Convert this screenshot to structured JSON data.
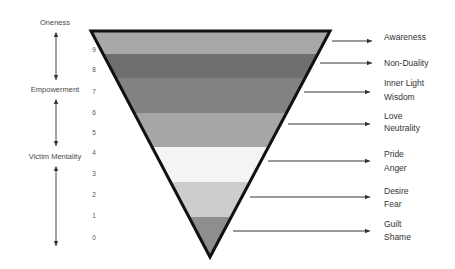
{
  "left_axis": {
    "labels": [
      {
        "text": "Oneness",
        "x": 55,
        "y": 25
      },
      {
        "text": "Empowerment",
        "x": 55,
        "y": 92
      },
      {
        "text": "Victim Mentality",
        "x": 55,
        "y": 159
      }
    ]
  },
  "levels": [
    "9",
    "8",
    "7",
    "6",
    "5",
    "4",
    "3",
    "2",
    "1",
    "0"
  ],
  "bands": [
    {
      "color": "#a8a8a8"
    },
    {
      "color": "#6f6f6f"
    },
    {
      "color": "#838383"
    },
    {
      "color": "#a6a6a6"
    },
    {
      "color": "#f4f4f4"
    },
    {
      "color": "#cdcdcd"
    },
    {
      "color": "#8e8e8e"
    }
  ],
  "right_labels": [
    {
      "line1": "Awareness",
      "line2": ""
    },
    {
      "line1": "Non-Duality",
      "line2": ""
    },
    {
      "line1": "Inner Light",
      "line2": "Wisdom"
    },
    {
      "line1": "Love",
      "line2": "Neutrality"
    },
    {
      "line1": "Pride",
      "line2": "Anger"
    },
    {
      "line1": "Desire",
      "line2": "Fear"
    },
    {
      "line1": "Guilt",
      "line2": "Shame"
    }
  ],
  "colors": {
    "outline": "#111111",
    "arrow": "#333333"
  }
}
